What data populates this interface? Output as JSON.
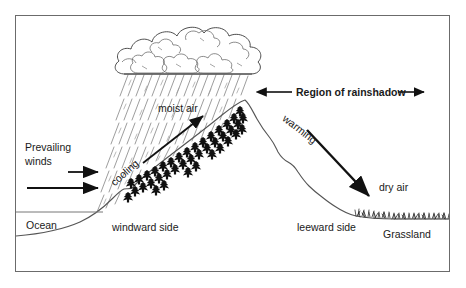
{
  "diagram": {
    "frame": {
      "border_color": "#6b6b6b"
    },
    "colors": {
      "ink": "#1a1a1a",
      "terrain_line": "#555555",
      "rain": "#8a8a8a",
      "cloud_outline": "#3a3a3a",
      "ocean_line": "#777777"
    },
    "labels": {
      "prevailing_winds_line1": "Prevailing",
      "prevailing_winds_line2": "winds",
      "ocean": "Ocean",
      "windward_side": "windward side",
      "cooling": "cooling",
      "moist_air": "moist air",
      "region_of_rainshadow": "Region of rainshadow",
      "warming": "warming",
      "dry_air": "dry air",
      "leeward_side": "leeward side",
      "grassland": "Grassland"
    },
    "features": {
      "cloud": "cumulus-cloud-mass",
      "rain": "rain-streaks",
      "forest": "conifer-forest-windward",
      "grass": "grass-tufts-leeward",
      "wind_arrows": 2,
      "moist_air_arrow": "up-right",
      "dry_air_arrow": "down-right",
      "rainshadow_arrow": "double-headed-horizontal"
    }
  }
}
